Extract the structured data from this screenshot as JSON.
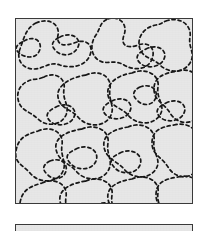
{
  "figure": {
    "canvas": {
      "width": 206,
      "height": 231,
      "background": "#ffffff"
    },
    "panel": {
      "name": "microstructure-panel",
      "x": 15,
      "y": 18,
      "width": 178,
      "height": 186,
      "fill": "#e7e7e7",
      "border_color": "#3a3a3a",
      "border_width": 1.4,
      "description": "Square field filled with irregular closed organic domain boundaries drawn as dashed black contours"
    },
    "scale_bar": {
      "name": "scale-bar",
      "x": 15,
      "y": 224,
      "width": 178,
      "height": 8,
      "fill": "#e7e7e7",
      "border_color": "#3a3a3a",
      "border_width": 1.3
    },
    "contours": {
      "stroke_color": "#171717",
      "stroke_width": 1.7,
      "dash_on": 3.1,
      "dash_off": 3.0,
      "count": 26,
      "paths": [
        "M 20 4 C 34 -2 44 6 42 16 C 40 26 48 28 58 24 C 70 19 78 26 74 36 C 70 47 56 50 44 46 C 33 42 28 50 18 50 C 6 50 0 40 4 30 C 8 19 10 9 20 4 Z",
        "M 92 0 C 104 -4 112 6 108 16 C 104 27 112 30 122 26 C 133 22 140 30 136 40 C 132 51 118 52 108 46 C 98 40 92 46 84 42 C 74 37 74 24 80 16 C 85 8 84 3 92 0 Z",
        "M 150 2 C 164 -3 176 6 174 18 C 172 29 180 34 174 44 C 167 55 152 54 144 46 C 137 39 128 40 124 30 C 120 19 128 8 140 6 C 146 5 145 4 150 2 Z",
        "M 28 58 C 40 52 50 60 48 70 C 46 81 54 86 50 96 C 45 107 30 108 22 100 C 14 92 4 92 2 80 C 0 68 10 60 22 60 Z",
        "M 70 56 C 84 50 96 58 94 70 C 92 82 100 88 94 98 C 87 109 70 108 62 98 C 55 90 44 90 42 78 C 40 66 56 58 70 56 Z",
        "M 116 54 C 130 48 144 56 142 68 C 140 80 150 86 144 96 C 137 107 120 106 112 96 C 105 88 94 88 92 76 C 90 64 102 56 116 54 Z",
        "M 162 52 C 176 48 186 58 184 70 C 182 82 190 90 182 98 C 173 107 160 104 154 94 C 148 84 138 82 138 70 C 138 58 148 54 162 52 Z",
        "M 22 112 C 36 106 48 114 46 126 C 44 138 52 144 46 154 C 39 165 22 164 14 154 C 7 146 -2 144 0 132 C 2 120 8 116 22 112 Z",
        "M 66 110 C 80 104 94 112 92 124 C 90 136 98 142 92 152 C 85 163 68 162 60 152 C 53 144 42 142 40 130 C 38 118 52 112 66 110 Z",
        "M 112 108 C 126 102 140 110 138 122 C 136 134 146 140 140 150 C 133 161 116 160 108 150 C 101 142 90 140 88 128 C 86 116 98 110 112 108 Z",
        "M 158 106 C 172 102 184 112 182 124 C 180 136 188 142 180 152 C 171 162 158 158 152 148 C 146 138 136 136 136 124 C 136 112 144 108 158 106 Z",
        "M 26 164 C 40 158 52 166 50 178 C 48 190 56 196 50 206 C 43 217 26 216 18 206 C 11 198 2 196 4 184 C 6 172 12 168 26 164 Z",
        "M 70 162 C 84 156 98 164 96 176 C 94 188 102 194 96 204 C 89 215 72 214 64 204 C 57 196 46 194 44 182 C 42 170 56 164 70 162 Z",
        "M 116 160 C 130 154 144 162 142 174 C 140 186 150 192 144 202 C 137 213 120 212 112 202 C 105 194 94 192 92 180 C 90 168 102 162 116 160 Z",
        "M 162 158 C 176 154 188 164 186 176 C 184 188 192 194 184 204 C 175 214 162 210 156 200 C 150 190 140 188 140 176 C 140 164 148 160 162 158 Z",
        "M 8 22 C 18 16 26 22 24 30 C 22 38 14 40 6 36 C -2 31 -2 27 8 22 Z",
        "M 44 18 C 56 12 66 20 62 28 C 58 37 46 38 40 32 C 34 26 36 22 44 18 Z",
        "M 96 82 C 108 76 118 84 114 92 C 110 101 96 102 90 96 C 84 90 88 86 96 82 Z",
        "M 40 88 C 52 82 62 90 58 98 C 54 107 40 108 34 102 C 28 96 32 92 40 88 Z",
        "M 130 30 C 142 24 152 32 148 40 C 144 49 130 50 124 44 C 118 38 122 34 130 30 Z",
        "M 60 130 C 72 124 84 132 80 142 C 76 152 60 152 54 144 C 48 137 52 134 60 130 Z",
        "M 104 134 C 116 128 128 136 124 146 C 120 156 104 156 98 148 C 92 141 96 138 104 134 Z",
        "M 150 84 C 162 78 172 86 168 94 C 164 103 150 104 144 98 C 138 92 142 88 150 84 Z",
        "M 34 142 C 44 138 52 144 50 152 C 48 160 38 162 32 156 C 26 151 26 146 34 142 Z",
        "M 80 186 C 92 180 104 188 100 198 C 96 208 80 208 74 200 C 68 193 72 190 80 186 Z",
        "M 124 68 C 134 64 142 70 140 78 C 138 86 128 88 122 82 C 116 77 116 72 124 68 Z"
      ]
    }
  }
}
